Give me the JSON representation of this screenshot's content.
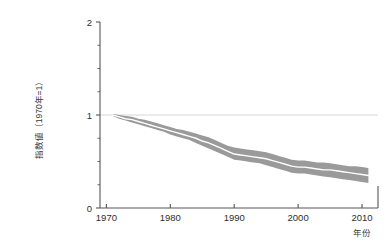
{
  "chart_data": {
    "type": "line",
    "title": "",
    "subtitle": "",
    "xlabel": "年份",
    "ylabel": "指数値（1970年=1）",
    "xlim": [
      1969,
      2012.5
    ],
    "ylim": [
      0,
      2
    ],
    "xticks": [
      1970,
      1980,
      1990,
      2000,
      2010
    ],
    "xtick_labels": [
      "1970",
      "1980",
      "1990",
      "2000",
      "2010"
    ],
    "yticks": [
      0,
      1,
      2
    ],
    "ytick_labels": [
      "0",
      "1",
      "2"
    ],
    "yminorticks": [
      0.25,
      0.5,
      0.75,
      1.25,
      1.5,
      1.75
    ],
    "grid": false,
    "legend": "none",
    "reference_line": {
      "y": 1,
      "label": "",
      "color": "#d8d8d8"
    },
    "band_color": "#9a9a9a",
    "line_color": "#ffffff",
    "axis_color": "#555555",
    "x": [
      1971,
      1972,
      1973,
      1974,
      1975,
      1976,
      1977,
      1978,
      1979,
      1980,
      1981,
      1982,
      1983,
      1984,
      1985,
      1986,
      1987,
      1988,
      1989,
      1990,
      1991,
      1992,
      1993,
      1994,
      1995,
      1996,
      1997,
      1998,
      1999,
      2000,
      2001,
      2002,
      2003,
      2004,
      2005,
      2006,
      2007,
      2008,
      2009,
      2010,
      2011
    ],
    "series": [
      {
        "name": "指数値（中央値）",
        "values": [
          1.0,
          0.98,
          0.96,
          0.95,
          0.93,
          0.91,
          0.89,
          0.87,
          0.85,
          0.83,
          0.81,
          0.79,
          0.77,
          0.75,
          0.72,
          0.7,
          0.67,
          0.64,
          0.61,
          0.58,
          0.57,
          0.56,
          0.55,
          0.54,
          0.53,
          0.51,
          0.49,
          0.47,
          0.45,
          0.44,
          0.44,
          0.43,
          0.42,
          0.41,
          0.41,
          0.4,
          0.39,
          0.38,
          0.37,
          0.36,
          0.35
        ]
      },
      {
        "name": "上限（信頼区間）",
        "values": [
          1.01,
          1.0,
          0.99,
          0.98,
          0.96,
          0.95,
          0.93,
          0.91,
          0.89,
          0.87,
          0.85,
          0.84,
          0.82,
          0.8,
          0.78,
          0.76,
          0.73,
          0.7,
          0.67,
          0.65,
          0.64,
          0.63,
          0.62,
          0.61,
          0.6,
          0.58,
          0.56,
          0.54,
          0.52,
          0.51,
          0.51,
          0.5,
          0.49,
          0.49,
          0.48,
          0.47,
          0.46,
          0.45,
          0.45,
          0.44,
          0.43
        ]
      },
      {
        "name": "下限（信頼区間）",
        "values": [
          0.99,
          0.96,
          0.94,
          0.92,
          0.9,
          0.88,
          0.86,
          0.84,
          0.82,
          0.79,
          0.77,
          0.75,
          0.73,
          0.7,
          0.67,
          0.64,
          0.61,
          0.58,
          0.55,
          0.52,
          0.51,
          0.5,
          0.49,
          0.48,
          0.46,
          0.44,
          0.42,
          0.4,
          0.38,
          0.37,
          0.37,
          0.36,
          0.35,
          0.34,
          0.33,
          0.32,
          0.31,
          0.3,
          0.29,
          0.28,
          0.27
        ]
      }
    ]
  }
}
